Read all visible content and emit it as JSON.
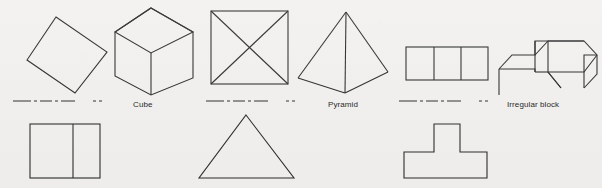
{
  "figure": {
    "background_color": "#f2f1ef",
    "ink_color": "#2b2b2b",
    "stroke_width": 1.1,
    "width": 602,
    "height": 188
  },
  "labels": [
    {
      "id": "cube",
      "text": "Cube",
      "x": 133,
      "y": 100
    },
    {
      "id": "pyramid",
      "text": "Pyramid",
      "x": 328,
      "y": 100
    },
    {
      "id": "irregular_block",
      "text": "Irregular block",
      "x": 507,
      "y": 100
    }
  ],
  "shapes": {
    "tilted_square": {
      "name": "tilted square",
      "points": "56,17 107,52 75,93 27,60"
    },
    "cube": {
      "name": "cube",
      "outline": "151,8 193,32 193,78 151,95 115,76 115,32",
      "top_face": "151,8 193,32 151,53 115,32",
      "vertical_edge": "151,53 151,95"
    },
    "square_with_diagonals": {
      "name": "square with diagonals",
      "rect": {
        "x": 211,
        "y": 11,
        "w": 77,
        "h": 73
      },
      "diagonal_1": "211,11 288,84",
      "diagonal_2": "288,11 211,84"
    },
    "pyramid": {
      "name": "pyramid",
      "left_edge": "346,12 298,78",
      "right_edge": "346,12 388,72",
      "front_left_base": "298,78 345,93",
      "front_right_base": "388,72 345,93",
      "center_edge": "346,12 345,93"
    },
    "three_cells": {
      "name": "three joined squares",
      "rect": {
        "x": 406,
        "y": 47,
        "w": 82,
        "h": 33
      },
      "divider_1_x": 434,
      "divider_2_x": 461
    },
    "irregular_block": {
      "name": "irregular block",
      "outline": "524,55 537,41 584,41 597,55 597,74 584,88 512,88 512,69 499,69 499,88 512,88 512,69 524,69",
      "paths": [
        "M535,72 L535,41 L584,41 L597,55 L597,74 L584,88",
        "M499,69 L512,55 L535,55 L535,41",
        "M535,55 L548,41 L584,41",
        "M548,41 L548,72 L561,88",
        "M499,69 L499,95",
        "M597,55 L584,55 L584,88",
        "M535,72 L548,72",
        "M499,69 L535,69 L535,72",
        "M548,72 L584,72 L597,55",
        "M548,72 L561,88"
      ]
    },
    "divided_rectangle": {
      "name": "rectangle divided by a vertical line",
      "rect": {
        "x": 30,
        "y": 124,
        "w": 70,
        "h": 54
      },
      "divider_x": 73
    },
    "triangle": {
      "name": "triangle",
      "points": "246,115 294,178 199,178"
    },
    "t_shape": {
      "name": "t-shape block",
      "points": "434,124 460,124 460,152 487,152 487,178 404,178 404,152 434,152"
    }
  },
  "separators": [
    {
      "id": "separator-left",
      "x1": 13,
      "y1": 101,
      "x2": 114,
      "y2": 101,
      "dash": "18,3,3,3,12,3,3,3,14"
    },
    {
      "id": "separator-middle",
      "x1": 206,
      "y1": 101,
      "x2": 300,
      "y2": 101,
      "dash": "18,3,3,3,12,3,3,3,14"
    },
    {
      "id": "separator-right",
      "x1": 399,
      "y1": 101,
      "x2": 496,
      "y2": 101,
      "dash": "18,3,3,3,12,3,3,3,14"
    }
  ]
}
